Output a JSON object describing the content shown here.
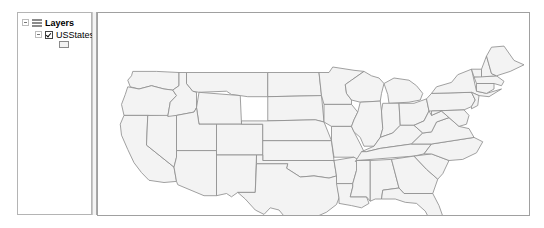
{
  "toc": {
    "root_label": "Layers",
    "layers": [
      {
        "name": "USStates",
        "checked": true,
        "symbol_fill": "#f3f3f3",
        "symbol_outline": "#8a8a8a"
      }
    ]
  },
  "map": {
    "fill": "#f3f3f3",
    "stroke": "#8c8c8c",
    "states": [
      {
        "name": "WA",
        "points": "23,44 42,44 60,45 60,57 55,61 48,60 38,57 28,60 21,58 19,52 22,48"
      },
      {
        "name": "OR",
        "points": "19,58 28,60 38,57 48,60 55,61 58,66 53,72 51,85 35,84 16,84 14,74 17,65"
      },
      {
        "name": "CA",
        "points": "16,84 35,84 34,111 56,131 58,144 48,145 36,143 30,136 24,127 19,115 14,102 13,92"
      },
      {
        "name": "NV",
        "points": "35,84 58,84 58,122 56,131 34,111"
      },
      {
        "name": "ID",
        "points": "60,45 66,45 66,55 71,62 74,63 74,77 72,81 58,84 51,85 53,72 58,66 55,61 60,57"
      },
      {
        "name": "MT",
        "points": "66,45 131,45 131,67 115,67 109,66 102,65 98,62 76,63 71,62 66,55"
      },
      {
        "name": "WY",
        "points": "76,63 109,66 110,92 76,92 74,77"
      },
      {
        "name": "UT",
        "points": "58,84 72,81 74,77 76,92 90,92 90,116 58,116"
      },
      {
        "name": "AZ",
        "points": "58,116 90,116 90,157 80,157 59,147 58,144 56,131 58,122"
      },
      {
        "name": "CO",
        "points": "90,92 127,92 127,120 90,120"
      },
      {
        "name": "NM",
        "points": "90,120 122,120 121,154 107,154 102,158 98,155 90,157"
      },
      {
        "name": "ND",
        "points": "131,45 172,45 174,66 131,67"
      },
      {
        "name": "SD",
        "points": "131,67 174,66 176,90 169,88 131,89"
      },
      {
        "name": "NE",
        "points": "110,89 131,89 169,88 176,90 182,107 127,107 127,92 110,92"
      },
      {
        "name": "KS",
        "points": "127,107 182,107 184,125 127,125"
      },
      {
        "name": "OK",
        "points": "122,120 127,120 127,125 184,125 186,139 180,141 168,139 157,140 146,132 147,128 122,128"
      },
      {
        "name": "TX",
        "points": "122,128 147,128 146,132 157,140 168,139 180,141 186,139 188,159 186,165 178,172 170,176 163,183 163,192 155,191 148,181 140,170 133,168 128,174 121,170 113,160 107,154 121,154"
      },
      {
        "name": "MN",
        "points": "172,45 180,45 183,40 200,43 208,44 198,52 193,56 194,64 198,70 198,74 176,74 174,66"
      },
      {
        "name": "IA",
        "points": "176,74 198,74 203,81 200,88 198,94 182,94 176,90"
      },
      {
        "name": "MO",
        "points": "182,94 198,94 200,99 205,110 208,117 206,126 201,126 200,122 184,122 182,107"
      },
      {
        "name": "AR",
        "points": "184,125 200,122 206,126 202,134 199,146 186,146 186,139"
      },
      {
        "name": "LA",
        "points": "186,146 199,146 199,149 197,158 210,158 212,164 206,168 198,166 188,164 188,159"
      },
      {
        "name": "WI",
        "points": "198,52 208,44 214,48 220,50 224,55 222,64 221,71 205,72 198,70 194,64 193,56"
      },
      {
        "name": "IL",
        "points": "205,72 221,71 222,80 223,96 221,104 216,112 208,112 205,104 200,99 198,94 200,88 203,81"
      },
      {
        "name": "MI",
        "points": "224,55 232,50 244,52 250,57 255,64 253,70 244,72 228,73 227,65"
      },
      {
        "name": "IN",
        "points": "223,73 236,73 237,93 231,100 221,104 223,96 222,80"
      },
      {
        "name": "OH",
        "points": "236,73 248,73 258,69 260,80 256,89 248,93 237,93"
      },
      {
        "name": "KY",
        "points": "206,117 216,112 221,104 231,100 237,93 248,93 255,100 246,110 221,114 210,117"
      },
      {
        "name": "TN",
        "points": "201,126 206,117 210,117 221,114 246,110 262,110 256,119 248,121 202,125"
      },
      {
        "name": "MS",
        "points": "199,146 202,134 202,125 213,125 213,162 210,158 197,158 199,149"
      },
      {
        "name": "AL",
        "points": "213,125 230,124 236,150 223,152 222,160 217,160 213,162"
      },
      {
        "name": "GA",
        "points": "230,124 248,121 258,133 267,142 263,155 240,155 236,150"
      },
      {
        "name": "FL",
        "points": "222,160 223,152 236,150 240,155 263,155 268,166 273,182 277,196 271,195 263,184 257,171 250,164 241,163 233,160"
      },
      {
        "name": "SC",
        "points": "248,121 262,119 276,125 271,137 267,142 258,133"
      },
      {
        "name": "NC",
        "points": "256,119 262,110 296,104 303,108 298,118 287,124 276,125 262,119"
      },
      {
        "name": "VA",
        "points": "246,110 255,100 262,99 266,90 276,86 284,94 292,96 296,104 262,110"
      },
      {
        "name": "WV",
        "points": "248,93 256,89 260,80 262,84 270,80 276,86 266,90 262,99 255,100"
      },
      {
        "name": "PA",
        "points": "258,69 262,64 294,63 297,70 294,76 288,79 262,80 260,80"
      },
      {
        "name": "MD",
        "points": "262,80 288,79 292,84 290,92 284,94 276,86 270,80 262,84"
      },
      {
        "name": "NY",
        "points": "262,64 266,58 278,54 283,47 294,42 298,62 306,64 318,60 308,67 300,66 294,63"
      },
      {
        "name": "NJ",
        "points": "294,63 300,66 299,75 294,78 294,76 297,70"
      },
      {
        "name": "CT",
        "points": "298,55 312,55 312,60 306,64 298,62"
      },
      {
        "name": "MA",
        "points": "296,49 314,48 320,53 318,57 312,55 298,55"
      },
      {
        "name": "VT",
        "points": "294,42 302,42 302,49 296,49"
      },
      {
        "name": "NH",
        "points": "302,42 306,30 310,46 314,48 302,49"
      },
      {
        "name": "ME",
        "points": "306,30 310,22 320,21 328,34 336,38 325,44 314,48 310,46"
      }
    ]
  }
}
